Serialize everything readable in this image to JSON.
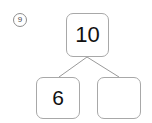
{
  "worksheet": {
    "problem_number": "9",
    "type": "number-bond",
    "colors": {
      "box_border": "#a8a8a8",
      "badge_border": "#8d8d8d",
      "connector_line": "#9a9a9a",
      "text": "#111111",
      "badge_text": "#4a4a4a",
      "background": "#ffffff"
    },
    "number_bond": {
      "total": {
        "label": "10",
        "filled": true
      },
      "parts": [
        {
          "label": "6",
          "filled": true
        },
        {
          "label": "",
          "filled": false
        }
      ]
    }
  }
}
